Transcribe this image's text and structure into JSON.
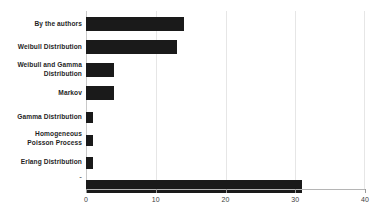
{
  "chart_data": {
    "type": "bar",
    "orientation": "horizontal",
    "title": "",
    "subtitle": "",
    "xlabel": "",
    "ylabel": "",
    "xlim": [
      0,
      40
    ],
    "ylim": null,
    "grid": true,
    "legend": null,
    "legend_position": "none",
    "bar_color": "#1a1a1a",
    "background_color": "#ffffff",
    "gridline_color": "#e6e6e6",
    "axis_color": "#b5b5b5",
    "xticks": [
      0,
      10,
      20,
      30,
      40
    ],
    "xtick_labels": [
      "0",
      "10",
      "20",
      "30",
      "40"
    ],
    "categories": [
      "By the authors",
      "Weibull Distribution",
      "Weibull and Gamma\nDistribution",
      "Markov",
      "Gamma Distribution",
      "Homogeneous\nPoisson Process",
      "Erlang Distribution",
      "-"
    ],
    "values": [
      14,
      13,
      4,
      4,
      1,
      1,
      1,
      31
    ],
    "bars": [
      {
        "label": "By the authors",
        "value": 14
      },
      {
        "label": "Weibull Distribution",
        "value": 13
      },
      {
        "label": "Weibull and Gamma\nDistribution",
        "value": 4
      },
      {
        "label": "Markov",
        "value": 4
      },
      {
        "label": "Gamma Distribution",
        "value": 1
      },
      {
        "label": "Homogeneous\nPoisson Process",
        "value": 1
      },
      {
        "label": "Erlang Distribution",
        "value": 1
      },
      {
        "label": "-",
        "value": 31
      }
    ]
  }
}
